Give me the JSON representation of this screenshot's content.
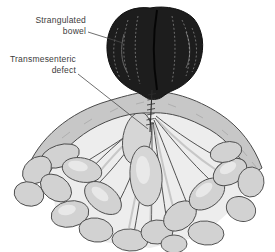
{
  "figure": {
    "annotations": {
      "strangulated_bowel": {
        "text": "Strangulated bowel",
        "line1": "Strangulated",
        "line2": "bowel"
      },
      "transmesenteric_defect": {
        "text": "Transmesenteric defect",
        "line1": "Transmesenteric",
        "line2": "defect"
      }
    },
    "colors": {
      "background": "#ffffff",
      "label_text": "#3c3c3c",
      "leader_line": "#4a4a4a",
      "strangulated_mass": "#1d1d1d",
      "mass_highlight": "#909090",
      "mesentery_dome": "#c7c7c7",
      "mesentery_field": "#ededed",
      "vessel_ink": "#383838",
      "bowel_loop_fill": "#d2d2d2",
      "outline_ink": "#4a4a4a",
      "stitch_ink": "#2c2c2c"
    }
  }
}
